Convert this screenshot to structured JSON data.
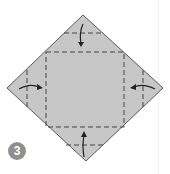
{
  "diagram": {
    "type": "origami-fold-step",
    "step_number": "3",
    "colors": {
      "paper": "#c7c7c7",
      "outline": "#5a5a5a",
      "fold_line": "#444444",
      "arrow": "#222222",
      "badge": "#8f8f8f"
    },
    "paper_shape": "diamond (square rotated 45°)",
    "fold_lines": [
      "inner square (valley folds)",
      "top corner fold line",
      "bottom corner fold line",
      "left corner fold line",
      "right corner fold line"
    ],
    "arrows": [
      "top corner folds down",
      "bottom corner folds up",
      "left corner folds right",
      "right corner folds left"
    ]
  }
}
